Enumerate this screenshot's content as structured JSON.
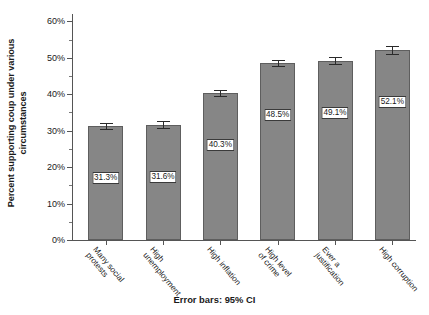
{
  "chart_data": {
    "type": "bar",
    "title": "",
    "xlabel": "",
    "ylabel_line1": "Percent supporting coup under various",
    "ylabel_line2": "circumstances",
    "categories": [
      "Many social protests",
      "High unemployment",
      "High inflation",
      "High level of crime",
      "Ever a justification",
      "High corruption"
    ],
    "categories_wrapped": [
      [
        "Many social",
        "protests"
      ],
      [
        "High",
        "unemployment"
      ],
      [
        "High inflation"
      ],
      [
        "High level",
        "of crime"
      ],
      [
        "Ever a",
        "justification"
      ],
      [
        "High corruption"
      ]
    ],
    "bars": [
      {
        "category": "Many social protests",
        "label_line1": "Many social",
        "label_line2": "protests",
        "value": 31.3,
        "value_label": "31.3%",
        "ci_low": 30.4,
        "ci_high": 32.2
      },
      {
        "category": "High unemployment",
        "label_line1": "High",
        "label_line2": "unemployment",
        "value": 31.6,
        "value_label": "31.6%",
        "ci_low": 30.7,
        "ci_high": 32.6
      },
      {
        "category": "High inflation",
        "label_line1": "High inflation",
        "label_line2": "",
        "value": 40.3,
        "value_label": "40.3%",
        "ci_low": 39.4,
        "ci_high": 41.2
      },
      {
        "category": "High level of crime",
        "label_line1": "High level",
        "label_line2": "of crime",
        "value": 48.5,
        "value_label": "48.5%",
        "ci_low": 47.6,
        "ci_high": 49.5
      },
      {
        "category": "Ever a justification",
        "label_line1": "Ever a",
        "label_line2": "justification",
        "value": 49.1,
        "value_label": "49.1%",
        "ci_low": 48.2,
        "ci_high": 50.1
      },
      {
        "category": "High corruption",
        "label_line1": "High corruption",
        "label_line2": "",
        "value": 52.1,
        "value_label": "52.1%",
        "ci_low": 51.1,
        "ci_high": 53.1
      }
    ],
    "values": [
      31.3,
      31.6,
      40.3,
      48.5,
      49.1,
      52.1
    ],
    "value_labels": [
      "31.3%",
      "31.6%",
      "40.3%",
      "48.5%",
      "49.1%",
      "52.1%"
    ],
    "ylim": [
      0,
      62
    ],
    "ytick_values": [
      0,
      10,
      20,
      30,
      40,
      50,
      60
    ],
    "ytick_labels": [
      "0%",
      "10%",
      "20%",
      "30%",
      "40%",
      "50%",
      "60%"
    ],
    "yminor_values": [
      5,
      15,
      25,
      35,
      45,
      55
    ],
    "grid": false,
    "legend": "none",
    "error_bars_note": "Error bars: 95% CI",
    "colors": {
      "bar_fill": "#868686",
      "bar_edge": "#5e5e5e",
      "axis": "#555555",
      "text": "#1a1a1a",
      "background": "#ffffff",
      "error_bar": "#2a2a2a"
    }
  }
}
